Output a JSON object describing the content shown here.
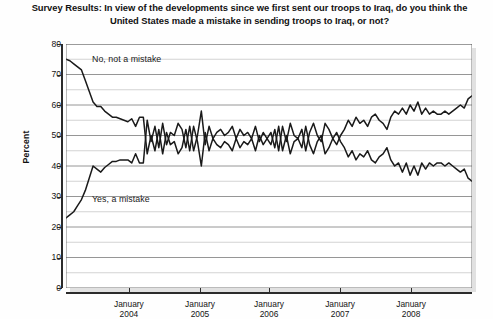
{
  "title": "Survey Results: In view of the developments since we first sent our troops to Iraq, do you think the United States made a mistake in sending troops to Iraq, or not?",
  "axis": {
    "ylabel": "Percent"
  },
  "annotations": {
    "no_label": "No, not a mistake",
    "yes_label": "Yes, a mistake"
  },
  "colors": {
    "line": "#1a1a1a",
    "gridline_major": "#8a8a8a",
    "gridline_minor": "#c4c4c4",
    "axis": "#2b2b2b",
    "plot_background": "#ffffff"
  },
  "chart_data": {
    "type": "line",
    "title": "Survey Results: In view of the developments since we first sent our troops to Iraq, do you think the United States made a mistake in sending troops to Iraq, or not?",
    "xlabel": "",
    "ylabel": "Percent",
    "ylim": [
      0,
      80
    ],
    "yticks": [
      0,
      10,
      20,
      30,
      40,
      50,
      60,
      70,
      80
    ],
    "ytick_labels": [
      "0",
      "10",
      "20",
      "30",
      "40",
      "50",
      "60",
      "70",
      "80"
    ],
    "minor_yticks": [
      5,
      15,
      25,
      35,
      45,
      55,
      65,
      75
    ],
    "grid": true,
    "legend": "inline-annotations",
    "xtick_labels": [
      "January\n2004",
      "January\n2005",
      "January\n2006",
      "January\n2007",
      "January\n2008"
    ],
    "xticks": [
      "January 2004",
      "January 2005",
      "January 2006",
      "January 2007",
      "January 2008"
    ],
    "xtick_positions": [
      0.155,
      0.33,
      0.5,
      0.675,
      0.85
    ],
    "xlim_description": "Mar 2003 through late 2008",
    "series": [
      {
        "name": "No, not a mistake",
        "values": [
          75,
          74.5,
          73.5,
          72.5,
          71.5,
          68,
          64.5,
          61,
          59.5,
          59.5,
          58,
          57,
          56,
          56,
          55.5,
          55,
          54.5,
          55.5,
          53,
          56,
          56,
          44,
          50,
          45,
          52,
          44,
          51,
          47,
          48,
          44,
          46,
          52,
          45,
          53,
          48,
          40,
          51,
          45,
          49,
          47,
          46,
          48,
          47,
          45,
          49,
          46,
          48,
          47,
          49,
          45,
          50,
          47,
          49,
          51,
          46,
          53,
          45,
          50,
          44,
          48,
          49,
          46,
          53,
          47,
          44,
          48,
          50,
          44,
          46,
          49,
          47,
          50,
          52,
          55,
          53,
          56,
          54,
          55,
          53,
          56,
          57,
          55,
          54,
          52,
          56,
          58,
          57,
          59,
          57,
          60,
          58,
          61,
          57,
          59,
          57,
          58,
          57,
          57,
          58,
          57,
          58,
          59,
          60,
          59,
          62,
          63
        ]
      },
      {
        "name": "Yes, a mistake",
        "values": [
          23,
          24,
          25,
          27,
          29,
          32,
          36,
          40,
          39,
          38,
          39.5,
          40.5,
          41.5,
          41.5,
          42,
          42,
          42,
          41,
          44,
          41,
          41,
          55,
          48,
          53,
          46,
          54,
          47,
          51,
          50,
          54,
          52,
          46,
          53,
          45,
          50,
          58,
          47,
          53,
          49,
          51,
          52,
          50,
          51,
          53,
          49,
          52,
          50,
          51,
          49,
          53,
          48,
          51,
          49,
          47,
          52,
          45,
          53,
          48,
          54,
          50,
          49,
          52,
          45,
          51,
          54,
          50,
          48,
          54,
          52,
          49,
          51,
          48,
          46,
          43,
          45,
          42,
          44,
          43,
          45,
          42,
          41,
          43,
          44,
          46,
          42,
          40,
          41,
          38,
          41,
          37,
          40,
          37,
          41,
          39,
          41,
          40,
          41,
          41,
          40,
          41,
          40,
          39,
          38,
          39,
          36,
          35
        ]
      }
    ]
  }
}
